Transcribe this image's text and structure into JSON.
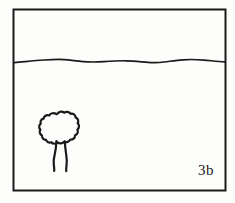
{
  "figure": {
    "label": "3b",
    "caption_label": "3b",
    "background_color": "#fdfdfb",
    "ink_color": "#1a1a1a",
    "frame": {
      "name": "picture-frame",
      "stroke_color": "#1a1a1a",
      "stroke_width": 2,
      "x": 13,
      "y": 9,
      "width": 213,
      "height": 182
    },
    "horizon": {
      "name": "horizon-line",
      "description": "undulating horizon line separating sky from ground",
      "stroke_color": "#1a1a1a",
      "stroke_width": 1.6,
      "y_average": 61
    },
    "sky_region": {
      "name": "sky-region",
      "description": "empty area above the horizon line"
    },
    "ground_region": {
      "name": "ground-region",
      "description": "empty area below the horizon line"
    },
    "tree": {
      "name": "tree-drawing",
      "description": "small deciduous tree with lobed canopy and two-line trunk",
      "stroke_color": "#1a1a1a",
      "stroke_width": 2.2,
      "canopy_x": 41,
      "canopy_y": 113,
      "canopy_width": 40,
      "canopy_height": 40,
      "trunk_top_y": 145,
      "trunk_bottom_y": 171
    }
  }
}
